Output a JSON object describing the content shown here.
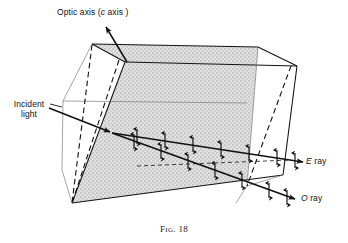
{
  "figure": {
    "caption_prefix": "F",
    "caption_rest": "IG",
    "caption_number": ". 18",
    "caption_full": "Fig. 18",
    "background_color": "#ffffff",
    "line_color": "#111111",
    "face_fill_color": "#d9d9d9"
  },
  "labels": {
    "optic_axis": {
      "text_main": "Optic axis (",
      "text_italic": "c",
      "text_tail": " axis )",
      "full": "Optic axis ( c axis )"
    },
    "incident_light": {
      "line1": "Incident",
      "line2": "light",
      "full": "Incident light"
    },
    "e_ray": {
      "italic": "E",
      "text": " ray",
      "full": "E ray"
    },
    "o_ray": {
      "italic": "O",
      "text": " ray",
      "full": "O ray"
    }
  },
  "geometry": {
    "shaded_front_face": "125,62 297,66 283,175 72,203",
    "top_face": "125,62 297,66 258,47 92,44",
    "right_face": "297,66 283,175 247,186 258,47",
    "crystal_outline": "92,44 258,47 297,66 283,175 72,203 62,170 63,101",
    "hidden_edge_style": "dashed",
    "face_texture": "stipple"
  },
  "rays": {
    "optic_axis_arrow": {
      "from": "127,62",
      "to": "104,24"
    },
    "incident_arrow": {
      "from": "48,108",
      "to": "112,133"
    },
    "e_ray_path": "112,133 305,162",
    "o_ray_path": "112,133 297,199",
    "polarization_marker": "double-headed-vertical-arrow",
    "e_ray_markers_count": 7,
    "o_ray_markers_count": 7
  }
}
